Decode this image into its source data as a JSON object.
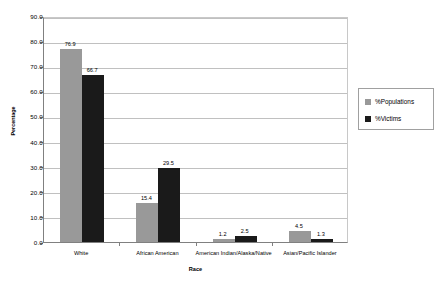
{
  "chart_data": {
    "type": "bar",
    "title": "",
    "xlabel": "Race",
    "ylabel": "Percentage",
    "categories": [
      "White",
      "African American",
      "American Indian/Alaska/Native",
      "Asian/Pacific Islander"
    ],
    "series": [
      {
        "name": "%Populations",
        "color": "#999999",
        "values": [
          76.9,
          15.4,
          1.2,
          4.5
        ]
      },
      {
        "name": "%Victims",
        "color": "#1a1a1a",
        "values": [
          66.7,
          29.5,
          2.5,
          1.3
        ]
      }
    ],
    "ylim": [
      0.0,
      90.0
    ],
    "ytick_step": 10.0,
    "ytick_labels": [
      "0.0",
      "10.0",
      "20.0",
      "30.0",
      "40.0",
      "50.0",
      "60.0",
      "70.0",
      "80.0",
      "90.0"
    ],
    "grid": true,
    "grid_axis": "y",
    "legend_position": "right",
    "data_labels": [
      [
        "76.9",
        "66.7"
      ],
      [
        "15.4",
        "29.5"
      ],
      [
        "1.2",
        "2.5"
      ],
      [
        "4.5",
        "1.3"
      ]
    ]
  },
  "legend": {
    "entries": [
      {
        "label": "%Populations"
      },
      {
        "label": "%Victims"
      }
    ]
  },
  "axes": {
    "x_title": "Race",
    "y_title": "Percentage"
  }
}
